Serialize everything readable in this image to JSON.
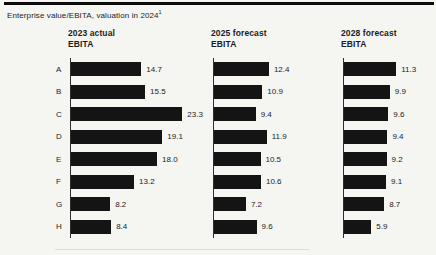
{
  "figure": {
    "title": "Enterprise value/EBITA, valuation in 2024",
    "title_superscript": "1"
  },
  "colors": {
    "bar": "#141414",
    "rule": "#0c0c0c",
    "background": "#f5f5f2"
  },
  "chart_data": [
    {
      "type": "bar",
      "orientation": "horizontal",
      "header_line1": "2023 actual",
      "header_line2": "EBITA",
      "categories": [
        "A",
        "B",
        "C",
        "D",
        "E",
        "F",
        "G",
        "H"
      ],
      "values": [
        14.7,
        15.5,
        23.3,
        19.1,
        18.0,
        13.2,
        8.2,
        8.4
      ],
      "xlim": [
        0,
        25
      ],
      "show_category_labels": true,
      "value_labels_visible": true,
      "grid": false
    },
    {
      "type": "bar",
      "orientation": "horizontal",
      "header_line1": "2025 forecast",
      "header_line2": "EBITA",
      "categories": [
        "A",
        "B",
        "C",
        "D",
        "E",
        "F",
        "G",
        "H"
      ],
      "values": [
        12.4,
        10.9,
        9.4,
        11.9,
        10.5,
        10.6,
        7.2,
        9.6
      ],
      "xlim": [
        0,
        25
      ],
      "show_category_labels": false,
      "value_labels_visible": true,
      "grid": false
    },
    {
      "type": "bar",
      "orientation": "horizontal",
      "header_line1": "2028 forecast",
      "header_line2": "EBITA",
      "categories": [
        "A",
        "B",
        "C",
        "D",
        "E",
        "F",
        "G",
        "H"
      ],
      "values": [
        11.3,
        9.9,
        9.6,
        9.4,
        9.2,
        9.1,
        8.7,
        5.9
      ],
      "xlim": [
        0,
        25
      ],
      "show_category_labels": false,
      "value_labels_visible": true,
      "grid": false
    }
  ]
}
